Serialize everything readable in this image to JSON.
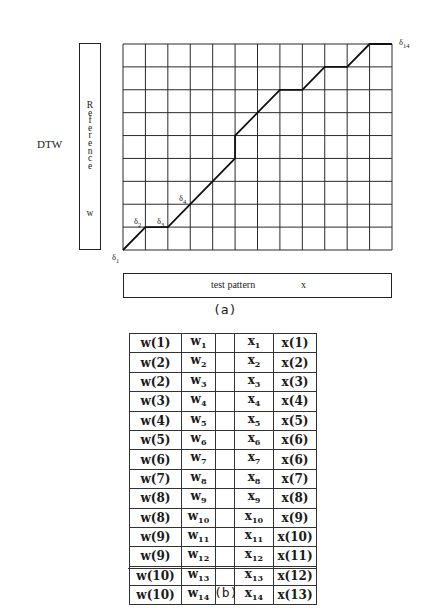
{
  "figure_a": {
    "side_label": "DTW",
    "reference_box": {
      "letters": [
        "R",
        "e",
        "f",
        "e",
        "r",
        "e",
        "n",
        "c",
        "e"
      ],
      "symbol": "w"
    },
    "test_box": {
      "label": "test pattern",
      "symbol": "x"
    },
    "grid": {
      "columns": 12,
      "rows": 9
    },
    "warping_path": [
      [
        0,
        0
      ],
      [
        1,
        1
      ],
      [
        2,
        1
      ],
      [
        5,
        4
      ],
      [
        5,
        5
      ],
      [
        7,
        7
      ],
      [
        8,
        7
      ],
      [
        9,
        8
      ],
      [
        10,
        8
      ],
      [
        11,
        9
      ],
      [
        12,
        9
      ]
    ],
    "delta_labels": [
      {
        "base": "δ",
        "sub": "1"
      },
      {
        "base": "δ",
        "sub": "2"
      },
      {
        "base": "δ",
        "sub": "3"
      },
      {
        "base": "δ",
        "sub": "4"
      },
      {
        "base": "δ",
        "sub": "14"
      }
    ],
    "caption": "(a)"
  },
  "figure_b": {
    "rows": [
      {
        "w_idx": "w(1)",
        "w_base": "w",
        "w_sub": "1",
        "x_base": "x",
        "x_sub": "1",
        "x_idx": "x(1)"
      },
      {
        "w_idx": "w(2)",
        "w_base": "w",
        "w_sub": "2",
        "x_base": "x",
        "x_sub": "2",
        "x_idx": "x(2)"
      },
      {
        "w_idx": "w(2)",
        "w_base": "w",
        "w_sub": "3",
        "x_base": "x",
        "x_sub": "3",
        "x_idx": "x(3)"
      },
      {
        "w_idx": "w(3)",
        "w_base": "w",
        "w_sub": "4",
        "x_base": "x",
        "x_sub": "4",
        "x_idx": "x(4)"
      },
      {
        "w_idx": "w(4)",
        "w_base": "w",
        "w_sub": "5",
        "x_base": "x",
        "x_sub": "5",
        "x_idx": "x(5)"
      },
      {
        "w_idx": "w(5)",
        "w_base": "w",
        "w_sub": "6",
        "x_base": "x",
        "x_sub": "6",
        "x_idx": "x(6)"
      },
      {
        "w_idx": "w(6)",
        "w_base": "w",
        "w_sub": "7",
        "x_base": "x",
        "x_sub": "7",
        "x_idx": "x(6)"
      },
      {
        "w_idx": "w(7)",
        "w_base": "w",
        "w_sub": "8",
        "x_base": "x",
        "x_sub": "8",
        "x_idx": "x(7)"
      },
      {
        "w_idx": "w(8)",
        "w_base": "w",
        "w_sub": "9",
        "x_base": "x",
        "x_sub": "9",
        "x_idx": "x(8)"
      },
      {
        "w_idx": "w(8)",
        "w_base": "w",
        "w_sub": "10",
        "x_base": "x",
        "x_sub": "10",
        "x_idx": "x(9)"
      },
      {
        "w_idx": "w(9)",
        "w_base": "w",
        "w_sub": "11",
        "x_base": "x",
        "x_sub": "11",
        "x_idx": "x(10)"
      },
      {
        "w_idx": "w(9)",
        "w_base": "w",
        "w_sub": "12",
        "x_base": "x",
        "x_sub": "12",
        "x_idx": "x(11)"
      },
      {
        "w_idx": "w(10)",
        "w_base": "w",
        "w_sub": "13",
        "x_base": "x",
        "x_sub": "13",
        "x_idx": "x(12)"
      },
      {
        "w_idx": "w(10)",
        "w_base": "w",
        "w_sub": "14",
        "x_base": "x",
        "x_sub": "14",
        "x_idx": "x(13)"
      }
    ],
    "caption": "(b)"
  }
}
